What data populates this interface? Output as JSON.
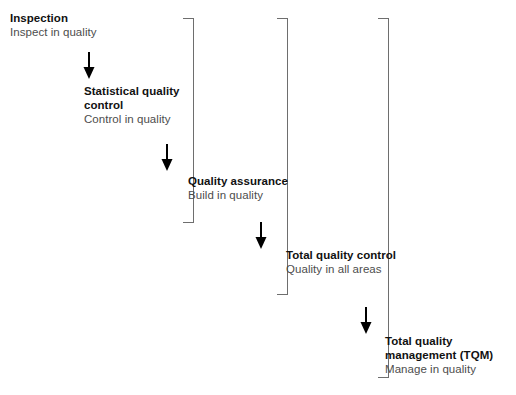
{
  "diagram": {
    "colors": {
      "heading_text": "#111111",
      "subtitle_text": "#4d4d4d",
      "bracket_line": "#6e6e6e",
      "arrow": "#000000",
      "background": "#ffffff"
    },
    "steps": [
      {
        "id": "inspection",
        "title": "Inspection",
        "subtitle": "Inspect in quality"
      },
      {
        "id": "statistical-quality-control",
        "title": "Statistical quality control",
        "subtitle": "Control in quality"
      },
      {
        "id": "quality-assurance",
        "title": "Quality assurance",
        "subtitle": "Build in quality"
      },
      {
        "id": "total-quality-control",
        "title": "Total quality control",
        "subtitle": "Quality in all areas"
      },
      {
        "id": "total-quality-management",
        "title": "Total quality management (TQM)",
        "subtitle": "Manage in quality"
      }
    ],
    "arrows": [
      {
        "id": "arrow-inspection-to-sqc",
        "direction": "down"
      },
      {
        "id": "arrow-sqc-to-qa",
        "direction": "down"
      },
      {
        "id": "arrow-qa-to-tqc",
        "direction": "down"
      },
      {
        "id": "arrow-tqc-to-tqm",
        "direction": "down"
      }
    ],
    "brackets": [
      {
        "id": "bracket-quality-assurance",
        "encloses": "Inspection and Statistical quality control"
      },
      {
        "id": "bracket-total-quality-control",
        "encloses": "Inspection through Quality assurance"
      },
      {
        "id": "bracket-total-quality-management",
        "encloses": "Inspection through Total quality control"
      }
    ],
    "caption": ""
  }
}
